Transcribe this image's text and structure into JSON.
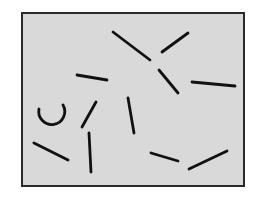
{
  "figure": {
    "canvas": {
      "width": 256,
      "height": 199,
      "background": "#ffffff"
    },
    "panel": {
      "x": 22,
      "y": 13,
      "width": 222,
      "height": 173,
      "fill": "#d9d9d9",
      "border_color": "#2a2a2a",
      "border_width": 2
    },
    "stroke": {
      "color": "#111111",
      "width": 2.8,
      "linecap": "round"
    },
    "segments": [
      {
        "x1": 113,
        "y1": 32,
        "x2": 150,
        "y2": 60
      },
      {
        "x1": 162,
        "y1": 52,
        "x2": 188,
        "y2": 33
      },
      {
        "x1": 159,
        "y1": 70,
        "x2": 178,
        "y2": 93
      },
      {
        "x1": 192,
        "y1": 82,
        "x2": 235,
        "y2": 86
      },
      {
        "x1": 77,
        "y1": 75,
        "x2": 107,
        "y2": 80
      },
      {
        "x1": 82,
        "y1": 127,
        "x2": 96,
        "y2": 102
      },
      {
        "x1": 128,
        "y1": 98,
        "x2": 134,
        "y2": 133
      },
      {
        "x1": 34,
        "y1": 143,
        "x2": 68,
        "y2": 160
      },
      {
        "x1": 89,
        "y1": 133,
        "x2": 91,
        "y2": 172
      },
      {
        "x1": 151,
        "y1": 153,
        "x2": 178,
        "y2": 161
      },
      {
        "x1": 189,
        "y1": 169,
        "x2": 227,
        "y2": 151
      }
    ],
    "arc": {
      "path": "M 39 109 A 13 13 0 1 0 63 105"
    }
  }
}
